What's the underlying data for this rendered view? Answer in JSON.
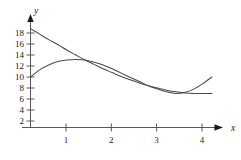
{
  "figure": {
    "background_color": "#ffffff",
    "axis_color": "#58585a",
    "curve_color": "#4a4a4c",
    "text_color": "#1a1a1a",
    "x_axis_name": "x",
    "y_axis_name": "y"
  },
  "chart_data": {
    "type": "line",
    "title": "",
    "subtitle": "",
    "xlabel": "x",
    "ylabel": "y",
    "xlim": [
      0,
      4.4
    ],
    "ylim": [
      0,
      20
    ],
    "grid": false,
    "legend": "none",
    "xticks": [
      1,
      2,
      3,
      4
    ],
    "xtick_labels": [
      "1",
      "2",
      "3",
      "4"
    ],
    "yticks": [
      2,
      4,
      6,
      8,
      10,
      12,
      14,
      16,
      18
    ],
    "ytick_labels": [
      "2",
      "4",
      "6",
      "8",
      "10",
      "12",
      "14",
      "16",
      "18"
    ],
    "annotations": [],
    "series": [
      {
        "name": "decreasing-convex-curve",
        "x": [
          0.0,
          0.2,
          0.4,
          0.6,
          0.8,
          1.0,
          1.2,
          1.4,
          1.6,
          1.8,
          2.0,
          2.2,
          2.4,
          2.6,
          2.8,
          3.0,
          3.2,
          3.4,
          3.6,
          3.8,
          4.0
        ],
        "y": [
          18.8,
          17.8,
          16.8,
          15.9,
          14.9,
          14.0,
          13.1,
          12.3,
          11.5,
          10.8,
          10.1,
          9.5,
          8.9,
          8.4,
          8.0,
          7.6,
          7.3,
          7.1,
          7.0,
          7.0,
          7.0
        ]
      },
      {
        "name": "rising-then-dipping-curve",
        "x": [
          0.0,
          0.2,
          0.4,
          0.6,
          0.8,
          1.0,
          1.2,
          1.4,
          1.6,
          1.8,
          2.0,
          2.2,
          2.4,
          2.6,
          2.8,
          3.0,
          3.2,
          3.4,
          3.6,
          3.8,
          4.0
        ],
        "y": [
          10.0,
          11.3,
          12.2,
          12.8,
          13.1,
          13.2,
          13.1,
          12.7,
          12.2,
          11.5,
          10.7,
          9.9,
          9.2,
          8.4,
          7.8,
          7.3,
          7.0,
          7.2,
          7.8,
          8.8,
          10.0
        ]
      }
    ],
    "intersections": [
      {
        "x": 1.2,
        "y": 13.1
      },
      {
        "x": 3.2,
        "y": 7.0
      }
    ]
  }
}
